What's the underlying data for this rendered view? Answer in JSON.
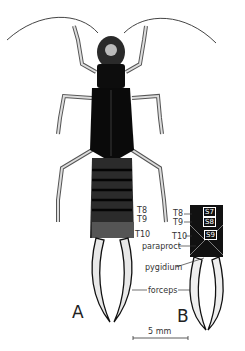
{
  "figure": {
    "panel_labels": {
      "a": "A",
      "b": "B"
    },
    "labels_a": {
      "t8": "T8",
      "t9": "T9",
      "t10": "T10"
    },
    "labels_b": {
      "s7": "S7",
      "s8": "S8",
      "s9": "S9",
      "t8": "T8",
      "t9": "T9",
      "t10": "T10",
      "paraproct": "paraproct",
      "pygidium": "pygidium",
      "forceps": "forceps"
    },
    "scale_bar": {
      "label": "5 mm"
    },
    "colors": {
      "ink": "#111111",
      "background": "#ffffff",
      "shade": "#555555"
    }
  }
}
